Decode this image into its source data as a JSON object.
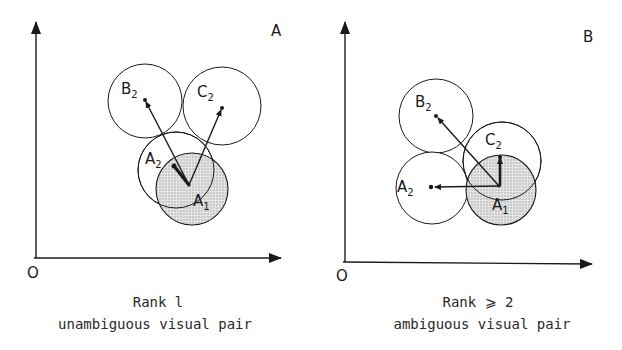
{
  "panels": [
    {
      "id": "A",
      "letter": "A",
      "origin_label": "O",
      "caption_line1": "Rank l",
      "caption_line2": "unambiguous visual pair",
      "circles": [
        {
          "name": "B",
          "sub": "2",
          "cx": 145,
          "cy": 101,
          "r": 37,
          "shaded": false
        },
        {
          "name": "C",
          "sub": "2",
          "cx": 222,
          "cy": 106,
          "r": 39,
          "shaded": false
        },
        {
          "name": "A",
          "sub": "2",
          "cx": 176,
          "cy": 170,
          "r": 38,
          "shaded": false
        },
        {
          "name": "A",
          "sub": "1",
          "cx": 192,
          "cy": 189,
          "r": 36,
          "shaded": true
        }
      ]
    },
    {
      "id": "B",
      "letter": "B",
      "origin_label": "O",
      "caption_line1": "Rank ⩾ 2",
      "caption_line2": "ambiguous visual pair",
      "circles": [
        {
          "name": "B",
          "sub": "2",
          "cx": 436,
          "cy": 116,
          "r": 37,
          "shaded": false
        },
        {
          "name": "C",
          "sub": "2",
          "cx": 502,
          "cy": 161,
          "r": 39,
          "shaded": false
        },
        {
          "name": "A",
          "sub": "2",
          "cx": 432,
          "cy": 188,
          "r": 36,
          "shaded": false
        },
        {
          "name": "A",
          "sub": "1",
          "cx": 501,
          "cy": 190,
          "r": 35,
          "shaded": true
        }
      ]
    }
  ],
  "colors": {
    "ink": "#1a1a1a",
    "shade": "#d9d9d9",
    "background": "#ffffff"
  }
}
